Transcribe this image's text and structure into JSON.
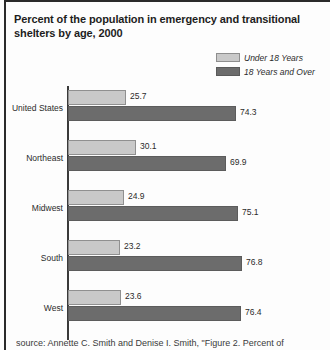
{
  "figure": {
    "title": "Percent of the population in emergency and transitional shelters by age, 2000",
    "source_note": "source: Annette C. Smith and Denise I. Smith, \"Figure 2. Percent of"
  },
  "legend": {
    "position": "top-right",
    "items": [
      {
        "label": "Under 18 Years",
        "color": "#c9c9c9",
        "swatch": "legend-swatch-under-18"
      },
      {
        "label": "18 Years and Over",
        "color": "#6c6c6c",
        "swatch": "legend-swatch-18-and-over"
      }
    ]
  },
  "colors": {
    "series_under_18": "#c9c9c9",
    "series_18_and_over": "#6c6c6c",
    "axis": "#3a3a3a",
    "text": "#2b2b2b",
    "rule": "#2a2a2a"
  },
  "chart_data": {
    "type": "bar",
    "orientation": "horizontal",
    "title": "Percent of the population in emergency and transitional shelters by age, 2000",
    "xlabel": "",
    "ylabel": "",
    "xlim": [
      0,
      100
    ],
    "grid": false,
    "legend_position": "top-right",
    "categories": [
      "United States",
      "Northeast",
      "Midwest",
      "South",
      "West"
    ],
    "series": [
      {
        "name": "Under 18 Years",
        "color": "#c9c9c9",
        "values": [
          25.7,
          30.1,
          24.9,
          23.2,
          23.6
        ]
      },
      {
        "name": "18 Years and Over",
        "color": "#6c6c6c",
        "values": [
          74.3,
          69.9,
          75.1,
          76.8,
          76.4
        ]
      }
    ],
    "value_labels": [
      {
        "category": "United States",
        "under_18": "25.7",
        "over_18": "74.3"
      },
      {
        "category": "Northeast",
        "under_18": "30.1",
        "over_18": "69.9"
      },
      {
        "category": "Midwest",
        "under_18": "24.9",
        "over_18": "75.1"
      },
      {
        "category": "South",
        "under_18": "23.2",
        "over_18": "76.8"
      },
      {
        "category": "West",
        "under_18": "23.6",
        "over_18": "76.4"
      }
    ]
  }
}
